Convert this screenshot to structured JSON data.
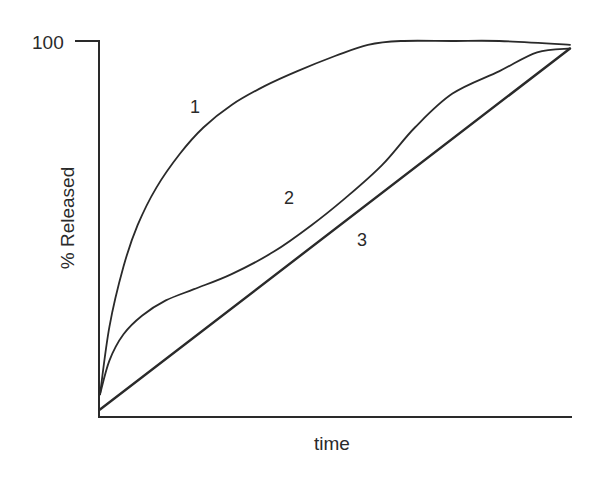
{
  "chart_data": {
    "type": "line",
    "title": "",
    "xlabel": "time",
    "ylabel": "% Released",
    "ytick_labels": [
      "100"
    ],
    "yticks": [
      100
    ],
    "xticks": [],
    "ylim": [
      0,
      100
    ],
    "xlim": [
      0,
      100
    ],
    "grid": false,
    "legend": "none (curves labeled inline with numbers 1, 2, 3)",
    "x_units": "normalized time (no tick labels shown)",
    "series": [
      {
        "name": "1",
        "description": "rapid initial release, plateau at 100%",
        "x": [
          0,
          2,
          5,
          8,
          12,
          17,
          22,
          28,
          35,
          42,
          50,
          57,
          64,
          75,
          85,
          100
        ],
        "values": [
          6,
          24,
          40,
          51,
          61,
          70,
          77,
          83,
          88,
          92,
          96,
          99,
          100,
          100,
          100,
          99
        ]
      },
      {
        "name": "2",
        "description": "sigmoidal release",
        "x": [
          0,
          2,
          5,
          9,
          14,
          20,
          28,
          37,
          45,
          52,
          60,
          67,
          75,
          85,
          93,
          100
        ],
        "values": [
          6,
          15,
          22,
          27,
          31,
          34,
          38,
          44,
          51,
          58,
          67,
          77,
          86,
          92,
          97,
          98
        ]
      },
      {
        "name": "3",
        "description": "zero-order (linear) release",
        "x": [
          0,
          100
        ],
        "values": [
          2,
          98
        ]
      }
    ],
    "annotations": [
      {
        "text": "1",
        "x": 20,
        "y": 82
      },
      {
        "text": "2",
        "x": 40,
        "y": 57
      },
      {
        "text": "3",
        "x": 56,
        "y": 46
      }
    ]
  },
  "axes": {
    "y_tick_label": "100",
    "y_label": "% Released",
    "x_label": "time"
  },
  "curve_labels": {
    "c1": "1",
    "c2": "2",
    "c3": "3"
  },
  "colors": {
    "line": "#2a2a2a",
    "axis": "#2a2a2a",
    "background": "#ffffff"
  }
}
